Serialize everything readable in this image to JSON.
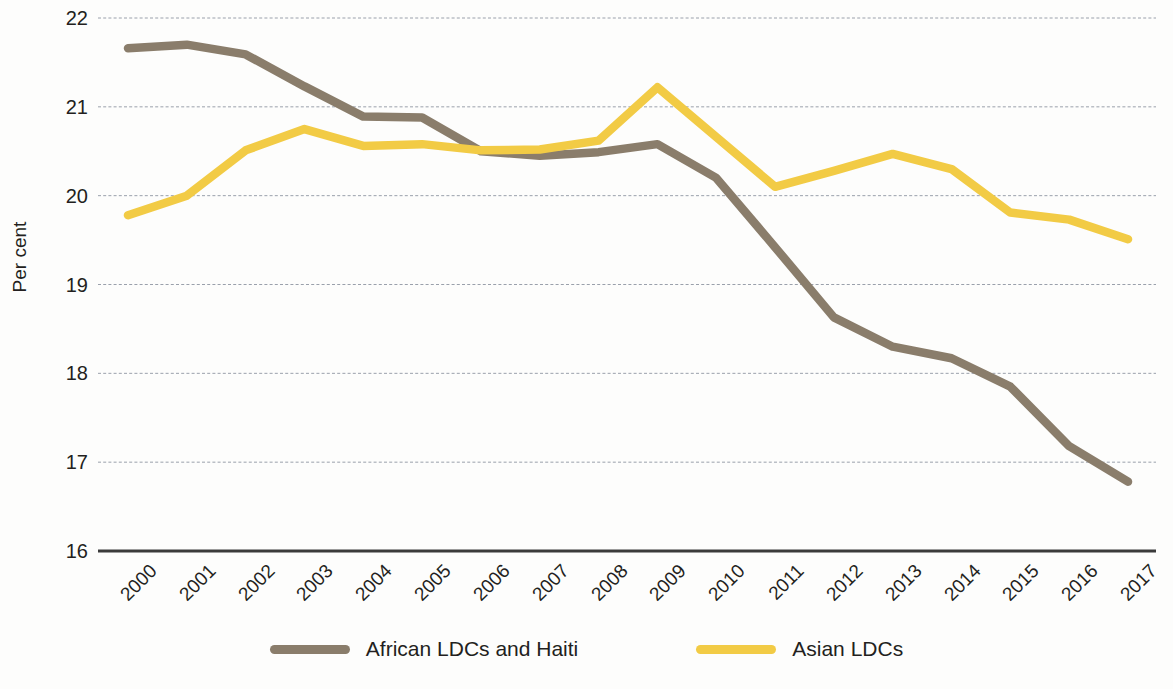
{
  "chart_data": {
    "type": "line",
    "title": "",
    "xlabel": "",
    "ylabel": "Per cent",
    "ylim": [
      16,
      22
    ],
    "yticks": [
      16,
      17,
      18,
      19,
      20,
      21,
      22
    ],
    "grid": true,
    "legend_position": "bottom",
    "categories": [
      "2000",
      "2001",
      "2002",
      "2003",
      "2004",
      "2005",
      "2006",
      "2007",
      "2008",
      "2009",
      "2010",
      "2011",
      "2012",
      "2013",
      "2014",
      "2015",
      "2016",
      "2017"
    ],
    "series": [
      {
        "name": "African LDCs and Haiti",
        "color": "#8a7d6b",
        "values": [
          21.66,
          21.7,
          21.59,
          21.23,
          20.89,
          20.88,
          20.5,
          20.45,
          20.49,
          20.58,
          20.2,
          19.42,
          18.63,
          18.3,
          18.17,
          17.85,
          17.18,
          16.78
        ]
      },
      {
        "name": "Asian LDCs",
        "color": "#f2cb45",
        "values": [
          19.78,
          20.0,
          20.51,
          20.75,
          20.56,
          20.58,
          20.51,
          20.52,
          20.62,
          21.22,
          20.66,
          20.1,
          20.28,
          20.47,
          20.3,
          19.81,
          19.73,
          19.51
        ]
      }
    ]
  },
  "axis": {
    "y_title": "Per cent"
  },
  "legend": {
    "items": [
      {
        "label": "African LDCs and Haiti",
        "color": "#8a7d6b"
      },
      {
        "label": "Asian LDCs",
        "color": "#f2cb45"
      }
    ]
  },
  "source_note": ""
}
